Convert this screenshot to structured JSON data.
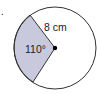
{
  "diagram": {
    "type": "circle-sector",
    "radius_label": "8 cm",
    "angle_label": "110°",
    "marker": ".",
    "colors": {
      "sector_fill": "#c9c9de",
      "circle_stroke": "#333333",
      "background": "#ffffff"
    }
  }
}
